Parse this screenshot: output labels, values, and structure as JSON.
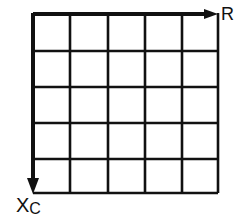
{
  "diagram": {
    "type": "grid",
    "rows": 5,
    "cols": 5,
    "grid_color": "#111111",
    "axes": {
      "horizontal": {
        "label": "R",
        "direction": "right"
      },
      "vertical": {
        "label_main": "X",
        "label_sub": "C",
        "direction": "down"
      }
    }
  }
}
